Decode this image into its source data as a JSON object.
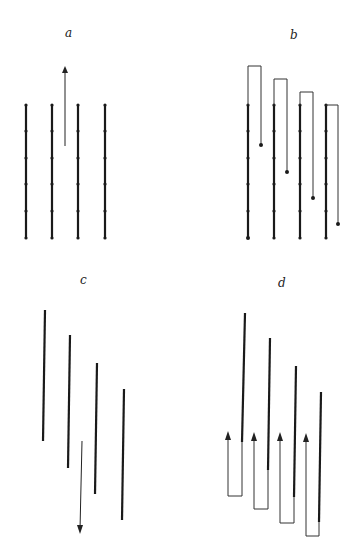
{
  "figure": {
    "panels": [
      {
        "id": "a",
        "label": "a"
      },
      {
        "id": "b",
        "label": "b"
      },
      {
        "id": "c",
        "label": "c"
      },
      {
        "id": "d",
        "label": "d"
      }
    ],
    "colors": {
      "thick_line": "#1a1a1a",
      "thin_line": "#333333",
      "background": "#ffffff"
    }
  }
}
